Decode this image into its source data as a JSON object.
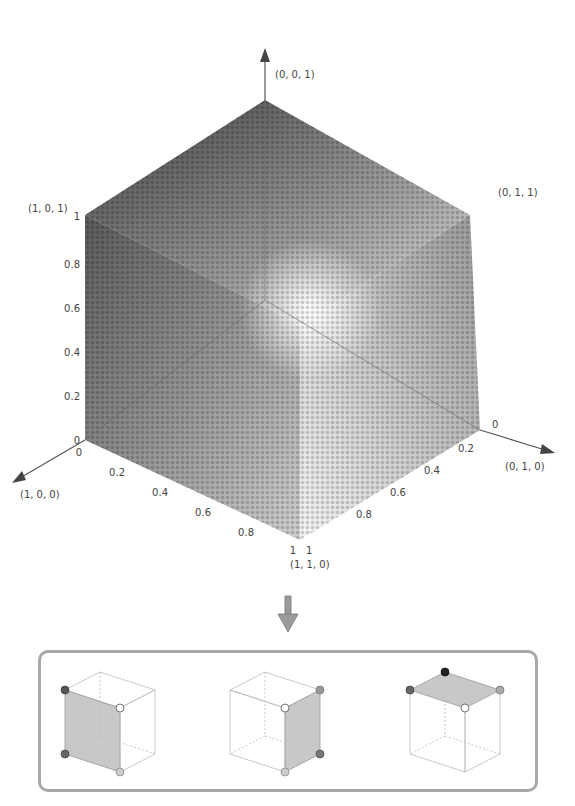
{
  "diagram": {
    "axes": {
      "z_label": "(0, 0, 1)",
      "y_label": "(0, 1, 0)",
      "x_label": "(1, 0, 0)"
    },
    "corners": {
      "top_left": "(1, 0, 1)",
      "top_right": "(0, 1, 1)",
      "bottom_front": "(1, 1, 0)"
    },
    "ticks": {
      "vertical": [
        "0",
        "0.2",
        "0.4",
        "0.6",
        "0.8",
        "1"
      ],
      "x_axis": [
        "0",
        "0.2",
        "0.4",
        "0.6",
        "0.8",
        "1"
      ],
      "y_axis": [
        "0",
        "0.2",
        "0.4",
        "0.6",
        "0.8",
        "1"
      ]
    },
    "colors": {
      "dark_dot": "#3a3a3a",
      "light_dot": "#ffffff",
      "axis": "#555555",
      "panel_border": "#a8a8a8",
      "face_fill": "#c8c8c8",
      "arrow_fill": "#9a9a9a"
    },
    "panel": {
      "cubes": [
        {
          "name": "left-face cube",
          "highlighted_face": "left"
        },
        {
          "name": "right-face cube",
          "highlighted_face": "right"
        },
        {
          "name": "top-face cube",
          "highlighted_face": "top"
        }
      ]
    }
  }
}
